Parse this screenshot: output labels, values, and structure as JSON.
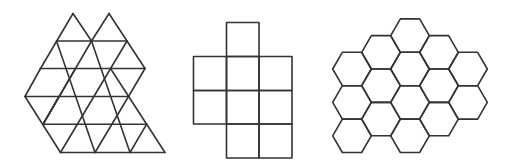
{
  "canvas": {
    "width": 517,
    "height": 164,
    "background": "#ffffff",
    "stroke_color": "#333333",
    "stroke_width": 1.6
  },
  "figures": [
    {
      "id": "triangle-tiling",
      "label": "triangular tiling",
      "tile_shape": "equilateral-triangle",
      "tile_count": 24,
      "lattice_rows": [
        {
          "y": 13.5,
          "x": [
            73,
            109
          ]
        },
        {
          "y": 41,
          "x": [
            56.5,
            91.5,
            127
          ]
        },
        {
          "y": 68.5,
          "x": [
            40.5,
            75.5,
            110.5,
            145
          ]
        },
        {
          "y": 96.5,
          "x": [
            25,
            59,
            94,
            128.5
          ]
        },
        {
          "y": 124.3,
          "x": [
            43,
            77.5,
            112,
            146.5
          ]
        },
        {
          "y": 152.5,
          "x": [
            60.5,
            95,
            130,
            165
          ]
        }
      ],
      "triangles": [
        [
          [
            0,
            0
          ],
          [
            1,
            0
          ],
          [
            1,
            1
          ]
        ],
        [
          [
            0,
            1
          ],
          [
            1,
            1
          ],
          [
            1,
            2
          ]
        ],
        [
          [
            1,
            0
          ],
          [
            1,
            1
          ],
          [
            0,
            1
          ]
        ],
        [
          [
            1,
            1
          ],
          [
            1,
            2
          ],
          [
            2,
            2
          ]
        ],
        [
          [
            1,
            1
          ],
          [
            2,
            1
          ],
          [
            2,
            2
          ]
        ],
        [
          [
            1,
            0
          ],
          [
            1,
            1
          ],
          [
            1,
            2
          ]
        ],
        [
          [
            1,
            0
          ],
          [
            2,
            0
          ],
          [
            2,
            1
          ]
        ],
        [
          [
            1,
            1
          ],
          [
            2,
            1
          ],
          [
            2,
            2
          ]
        ],
        [
          [
            1,
            2
          ],
          [
            2,
            2
          ],
          [
            2,
            3
          ]
        ],
        [
          [
            2,
            0
          ],
          [
            2,
            1
          ],
          [
            3,
            1
          ]
        ],
        [
          [
            2,
            1
          ],
          [
            2,
            2
          ],
          [
            3,
            2
          ]
        ],
        [
          [
            2,
            1
          ],
          [
            3,
            1
          ],
          [
            3,
            2
          ]
        ],
        [
          [
            2,
            0
          ],
          [
            3,
            0
          ],
          [
            3,
            1
          ]
        ],
        [
          [
            2,
            1
          ],
          [
            3,
            1
          ],
          [
            3,
            2
          ]
        ],
        [
          [
            2,
            2
          ],
          [
            3,
            2
          ],
          [
            3,
            3
          ]
        ],
        [
          [
            3,
            0
          ],
          [
            3,
            1
          ],
          [
            4,
            0
          ]
        ],
        [
          [
            3,
            1
          ],
          [
            3,
            2
          ],
          [
            4,
            1
          ]
        ],
        [
          [
            3,
            1
          ],
          [
            4,
            0
          ],
          [
            4,
            1
          ]
        ],
        [
          [
            3,
            1
          ],
          [
            3,
            2
          ],
          [
            4,
            1
          ]
        ],
        [
          [
            3,
            2
          ],
          [
            3,
            3
          ],
          [
            4,
            2
          ]
        ],
        [
          [
            3,
            2
          ],
          [
            4,
            1
          ],
          [
            4,
            2
          ]
        ],
        [
          [
            4,
            0
          ],
          [
            4,
            1
          ],
          [
            5,
            0
          ]
        ],
        [
          [
            4,
            1
          ],
          [
            4,
            2
          ],
          [
            5,
            1
          ]
        ],
        [
          [
            4,
            2
          ],
          [
            4,
            3
          ],
          [
            5,
            2
          ]
        ]
      ],
      "segments": [
        [
          [
            73,
            13.5
          ],
          [
            40.5,
            68.5
          ]
        ],
        [
          [
            73,
            13.5
          ],
          [
            91.5,
            41
          ]
        ],
        [
          [
            109,
            13.5
          ],
          [
            91.5,
            41
          ]
        ],
        [
          [
            109,
            13.5
          ],
          [
            145,
            68.5
          ]
        ],
        [
          [
            56.5,
            41
          ],
          [
            127,
            41
          ]
        ],
        [
          [
            40.5,
            68.5
          ],
          [
            145,
            68.5
          ]
        ],
        [
          [
            25,
            96.5
          ],
          [
            128.5,
            96.5
          ]
        ],
        [
          [
            43,
            124.3
          ],
          [
            146.5,
            124.3
          ]
        ],
        [
          [
            60.5,
            152.5
          ],
          [
            165,
            152.5
          ]
        ],
        [
          [
            40.5,
            68.5
          ],
          [
            25,
            96.5
          ]
        ],
        [
          [
            56.5,
            41
          ],
          [
            95,
            152.5
          ]
        ],
        [
          [
            91.5,
            41
          ],
          [
            43,
            124.3
          ]
        ],
        [
          [
            91.5,
            41
          ],
          [
            130,
            152.5
          ]
        ],
        [
          [
            127,
            41
          ],
          [
            60.5,
            152.5
          ]
        ],
        [
          [
            145,
            68.5
          ],
          [
            128.5,
            96.5
          ]
        ],
        [
          [
            25,
            96.5
          ],
          [
            60.5,
            152.5
          ]
        ],
        [
          [
            75.5,
            68.5
          ],
          [
            43,
            124.3
          ]
        ],
        [
          [
            110.5,
            68.5
          ],
          [
            165,
            152.5
          ]
        ],
        [
          [
            128.5,
            96.5
          ],
          [
            95,
            152.5
          ]
        ],
        [
          [
            146.5,
            124.3
          ],
          [
            130,
            152.5
          ]
        ],
        [
          [
            59,
            96.5
          ],
          [
            43,
            124.3
          ]
        ]
      ]
    },
    {
      "id": "square-tiling",
      "label": "square tiling",
      "tile_shape": "square",
      "tile_count": 9,
      "grid_x": [
        193.5,
        226.5,
        259,
        292
      ],
      "grid_y": [
        22.5,
        56.5,
        90.5,
        124,
        158
      ],
      "cells": [
        {
          "col": 1,
          "row": 0
        },
        {
          "col": 0,
          "row": 1
        },
        {
          "col": 1,
          "row": 1
        },
        {
          "col": 2,
          "row": 1
        },
        {
          "col": 0,
          "row": 2
        },
        {
          "col": 1,
          "row": 2
        },
        {
          "col": 2,
          "row": 2
        },
        {
          "col": 1,
          "row": 3
        },
        {
          "col": 2,
          "row": 3
        }
      ]
    },
    {
      "id": "hexagon-tiling",
      "label": "hexagonal tiling",
      "tile_shape": "regular-hexagon",
      "orientation": "flat-top",
      "tile_count": 15,
      "radius": 19.3,
      "half_height": 16.7,
      "columns": [
        {
          "cx": 352.0,
          "cy": [
            69,
            102.4,
            135.8
          ]
        },
        {
          "cx": 381.0,
          "cy": [
            52.3,
            85.7,
            119.1
          ]
        },
        {
          "cx": 410.0,
          "cy": [
            35.6,
            69,
            102.4,
            135.8
          ]
        },
        {
          "cx": 439.0,
          "cy": [
            52.3,
            85.7,
            119.1
          ]
        },
        {
          "cx": 468.0,
          "cy": [
            69,
            102.4
          ]
        }
      ]
    }
  ]
}
